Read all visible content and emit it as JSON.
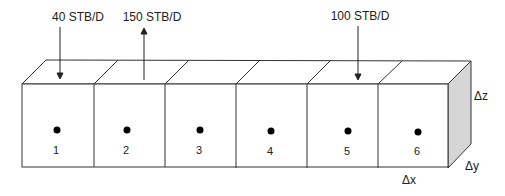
{
  "diagram": {
    "type": "1D reservoir grid block diagram",
    "cells": [
      {
        "id": "1",
        "label": "1"
      },
      {
        "id": "2",
        "label": "2"
      },
      {
        "id": "3",
        "label": "3"
      },
      {
        "id": "4",
        "label": "4"
      },
      {
        "id": "5",
        "label": "5"
      },
      {
        "id": "6",
        "label": "6"
      }
    ],
    "wells": [
      {
        "cell": "1",
        "rate_label": "40 STB/D",
        "direction": "injection (down arrow)"
      },
      {
        "cell": "2",
        "rate_label": "150 STB/D",
        "direction": "production (up arrow)"
      },
      {
        "cell": "5",
        "rate_label": "100 STB/D",
        "direction": "injection (down arrow)"
      }
    ],
    "dimensions": {
      "dx": "Δx",
      "dy": "Δy",
      "dz": "Δz"
    },
    "colors": {
      "line": "#333333",
      "side_face": "#d6d6d6",
      "node": "#000000"
    }
  }
}
